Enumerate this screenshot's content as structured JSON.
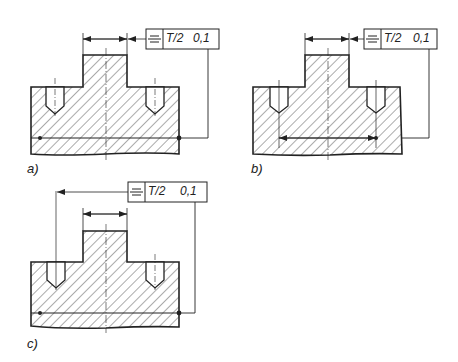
{
  "diagram": {
    "type": "technical-drawing",
    "panels": [
      {
        "label": "a)",
        "tolerance_frame": {
          "symbol": "symmetry",
          "symbol_glyph": "⌲",
          "value_1": "T/2",
          "value_2": "0,1"
        },
        "note": "Datum leader attached to full-width feature line at bottom"
      },
      {
        "label": "b)",
        "tolerance_frame": {
          "symbol": "symmetry",
          "symbol_glyph": "⌲",
          "value_1": "T/2",
          "value_2": "0,1"
        },
        "note": "Datum leader attached to hole-axis dimension line"
      },
      {
        "label": "c)",
        "tolerance_frame": {
          "symbol": "symmetry",
          "symbol_glyph": "⌲",
          "value_1": "T/2",
          "value_2": "0,1"
        },
        "note": "Leader from frame points to left hole axis; datum on bottom line"
      }
    ],
    "colors": {
      "line": "#222222",
      "hatch": "#444444",
      "background": "#ffffff"
    }
  }
}
